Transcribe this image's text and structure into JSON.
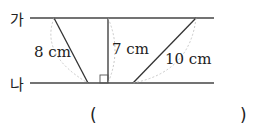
{
  "diagram": {
    "line_top_label": "가",
    "line_bottom_label": "나",
    "segments": [
      {
        "label": "8 cm"
      },
      {
        "label": "7 cm"
      },
      {
        "label": "10 cm"
      }
    ],
    "answer": {
      "open": "(",
      "close": ")"
    }
  }
}
